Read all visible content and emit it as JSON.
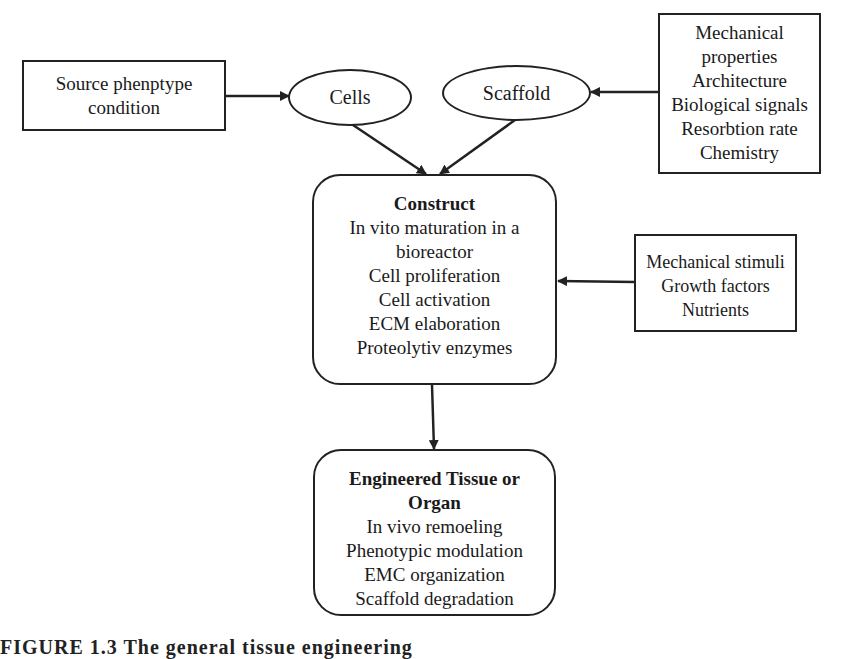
{
  "diagram": {
    "source_box": {
      "lines": [
        "Source phenptype",
        "condition"
      ]
    },
    "cells_node": {
      "label": "Cells"
    },
    "scaffold_node": {
      "label": "Scaffold"
    },
    "scaffold_properties": {
      "lines": [
        "Mechanical",
        "properties",
        "Architecture",
        "Biological signals",
        "Resorbtion rate",
        "Chemistry"
      ]
    },
    "construct": {
      "title": "Construct",
      "lines": [
        "In vito maturation in a",
        "bioreactor",
        "Cell proliferation",
        "Cell activation",
        "ECM elaboration",
        "Proteolytiv enzymes"
      ]
    },
    "stimuli_box": {
      "lines": [
        "Mechanical stimuli",
        "Growth factors",
        "Nutrients"
      ]
    },
    "engineered": {
      "title_lines": [
        "Engineered Tissue or",
        "Organ"
      ],
      "lines": [
        "In vivo remoeling",
        "Phenotypic modulation",
        "EMC organization",
        "Scaffold degradation"
      ]
    },
    "edges": [
      {
        "from": "source_box",
        "to": "cells_node"
      },
      {
        "from": "scaffold_properties",
        "to": "scaffold_node"
      },
      {
        "from": "cells_node",
        "to": "construct"
      },
      {
        "from": "scaffold_node",
        "to": "construct"
      },
      {
        "from": "stimuli_box",
        "to": "construct"
      },
      {
        "from": "construct",
        "to": "engineered"
      }
    ],
    "line_color": "#222222"
  },
  "caption": {
    "text": "FIGURE 1.3  The general tissue engineering"
  }
}
